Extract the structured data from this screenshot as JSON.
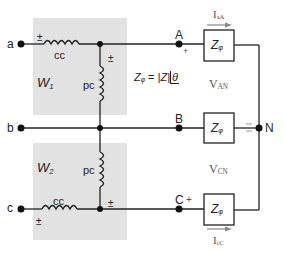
{
  "diagram": {
    "type": "two-wattmeter three-phase circuit",
    "colors": {
      "wire": "#222222",
      "meter_box": "#e2e2e2",
      "arrow": "#888888"
    },
    "source_terminals": [
      {
        "id": "a",
        "label": "a"
      },
      {
        "id": "b",
        "label": "b"
      },
      {
        "id": "c",
        "label": "c"
      }
    ],
    "load_nodes": [
      {
        "id": "A",
        "label": "A",
        "polarity": "+"
      },
      {
        "id": "B",
        "label": "B"
      },
      {
        "id": "C",
        "label": "C",
        "polarity": "+"
      },
      {
        "id": "N",
        "label": "N",
        "polarity": "−"
      }
    ],
    "wattmeters": [
      {
        "id": "W1",
        "label": "W",
        "sub": "1",
        "current_coil": "cc",
        "potential_coil": "pc",
        "cc_polarity": "±",
        "pc_polarity": "±"
      },
      {
        "id": "W2",
        "label": "W",
        "sub": "2",
        "current_coil": "cc",
        "potential_coil": "pc",
        "cc_polarity": "±",
        "pc_polarity": "±"
      }
    ],
    "impedances": [
      {
        "label": "Z",
        "sub": "φ"
      },
      {
        "label": "Z",
        "sub": "φ"
      },
      {
        "label": "Z",
        "sub": "φ"
      }
    ],
    "impedance_equation": {
      "lhs": "Z",
      "lhs_sub": "φ",
      "eq": "=",
      "mag": "|Z|",
      "angle": "θ"
    },
    "voltages": [
      {
        "label": "V",
        "sub": "AN"
      },
      {
        "label": "V",
        "sub": "CN"
      }
    ],
    "currents": [
      {
        "label": "I",
        "sub": "aA"
      },
      {
        "label": "I",
        "sub": "cC"
      }
    ]
  }
}
